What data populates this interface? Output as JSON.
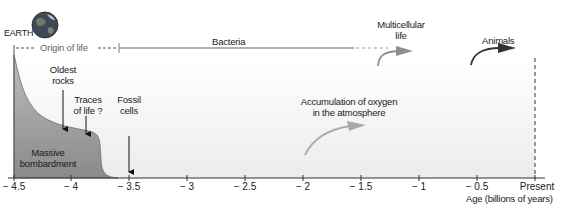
{
  "earth_label": "EARTH",
  "timeline": {
    "origin_of_life": "Origin of life",
    "bacteria": "Bacteria",
    "multicellular_life_line1": "Multicellular",
    "multicellular_life_line2": "life",
    "animals": "Animals"
  },
  "events": {
    "oldest_rocks_line1": "Oldest",
    "oldest_rocks_line2": "rocks",
    "traces_of_life_line1": "Traces",
    "traces_of_life_line2": "of life ?",
    "fossil_cells_line1": "Fossil",
    "fossil_cells_line2": "cells",
    "oxygen_line1": "Accumulation of oxygen",
    "oxygen_line2": "in the atmosphere"
  },
  "bombardment_line1": "Massive",
  "bombardment_line2": "bombardment",
  "axis": {
    "ticks": [
      "− 4.5",
      "− 4",
      "− 3.5",
      "− 3",
      "− 2.5",
      "− 2",
      "− 1.5",
      "− 1",
      "− 0.5",
      "Present"
    ],
    "label": "Age (billions of years)"
  },
  "colors": {
    "bombardment_fill": "#8c8c8c",
    "bacteria_line": "#9a9a9a",
    "oxygen_arrow": "#a8a8a8",
    "animals_arrow": "#333333",
    "background_gradient_end": "#ececec"
  }
}
